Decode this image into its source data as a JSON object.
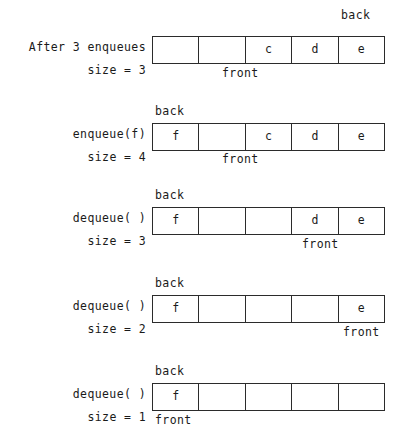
{
  "figure": {
    "capacity": 5,
    "ink_color": "#2b2b2b",
    "background": "#ffffff",
    "pointer_labels": {
      "front": "front",
      "back": "back"
    },
    "steps": [
      {
        "op": "After 3 enqueues",
        "size": "size = 3",
        "cells": [
          "",
          "",
          "c",
          "d",
          "e"
        ],
        "back_label": "back",
        "front_label": "front",
        "back_pos": "right",
        "front_pos": "index2"
      },
      {
        "op": "enqueue(f)",
        "size": "size = 4",
        "cells": [
          "f",
          "",
          "c",
          "d",
          "e"
        ],
        "back_label": "back",
        "front_label": "front",
        "back_pos": "index0",
        "front_pos": "index2"
      },
      {
        "op": "dequeue( )",
        "size": "size = 3",
        "cells": [
          "f",
          "",
          "",
          "d",
          "e"
        ],
        "back_label": "back",
        "front_label": "front",
        "back_pos": "index0",
        "front_pos": "index3"
      },
      {
        "op": "dequeue( )",
        "size": "size = 2",
        "cells": [
          "f",
          "",
          "",
          "",
          "e"
        ],
        "back_label": "back",
        "front_label": "front",
        "back_pos": "index0",
        "front_pos": "index4"
      },
      {
        "op": "dequeue( )",
        "size": "size = 1",
        "cells": [
          "f",
          "",
          "",
          "",
          ""
        ],
        "back_label": "back",
        "front_label": "front",
        "back_pos": "index0",
        "front_pos": "index0"
      }
    ]
  }
}
